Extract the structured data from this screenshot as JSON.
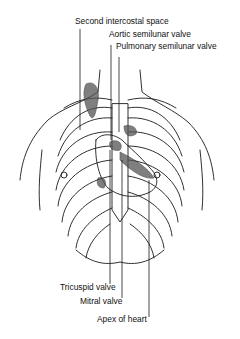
{
  "diagram": {
    "labels": {
      "second_intercostal_space": "Second intercostal space",
      "aortic_semilunar_valve": "Aortic semilunar valve",
      "pulmonary_semilunar_valve": "Pulmonary semilunar valve",
      "tricuspid_valve": "Tricuspid valve",
      "mitral_valve": "Mitral valve",
      "apex_of_heart": "Apex of heart"
    },
    "colors": {
      "line": "#1a1a1a",
      "shading": "#555555"
    }
  }
}
